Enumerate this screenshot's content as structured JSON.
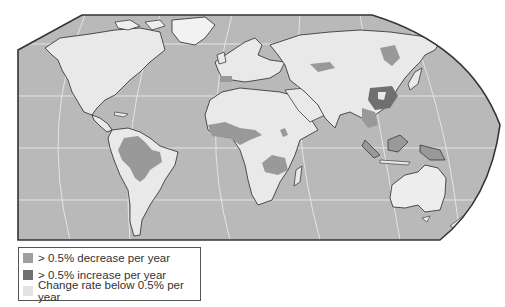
{
  "map": {
    "title": "",
    "colors": {
      "ocean": "#b9b9b9",
      "graticule": "#e6e6e6",
      "decrease": "#999999",
      "increase": "#6f6f6f",
      "stable": "#e9e9e9",
      "coast": "#2a2a2a",
      "frame": "#333333"
    }
  },
  "legend": {
    "items": [
      {
        "label": "> 0.5% decrease per year",
        "color": "#9f9f9f"
      },
      {
        "label": "> 0.5% increase per year",
        "color": "#707070"
      },
      {
        "label": "Change rate below 0.5% per year",
        "color": "#e3e3e3"
      }
    ]
  }
}
